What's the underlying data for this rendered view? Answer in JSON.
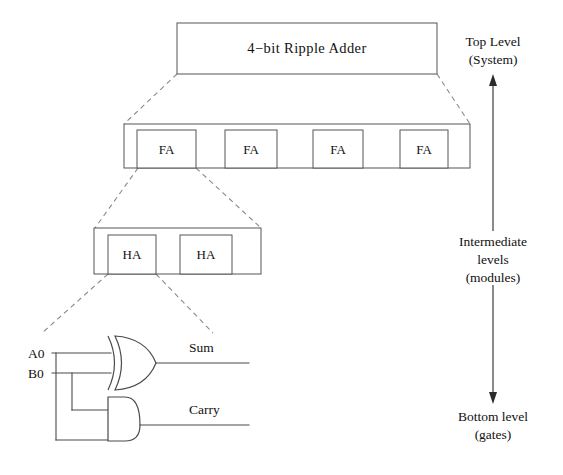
{
  "diagram": {
    "title_block": {
      "label": "4−bit Ripple Adder",
      "name": "top-level-system-block"
    },
    "intermediate_row_1": {
      "blocks": [
        {
          "label": "FA"
        },
        {
          "label": "FA"
        },
        {
          "label": "FA"
        },
        {
          "label": "FA"
        }
      ]
    },
    "intermediate_row_2": {
      "blocks": [
        {
          "label": "HA"
        },
        {
          "label": "HA"
        }
      ]
    },
    "gate_level": {
      "inputs": [
        {
          "label": "A0"
        },
        {
          "label": "B0"
        }
      ],
      "outputs": [
        {
          "label": "Sum",
          "gate": "xor-gate"
        },
        {
          "label": "Carry",
          "gate": "and-gate"
        }
      ]
    },
    "level_annotations": {
      "top": {
        "line1": "Top Level",
        "line2": "(System)"
      },
      "middle": {
        "line1": "Intermediate",
        "line2": "levels",
        "line3": "(modules)"
      },
      "bottom": {
        "line1": "Bottom level",
        "line2": "(gates)"
      }
    },
    "colors": {
      "background": "#ffffff",
      "box_stroke": "#555555",
      "dashed_link": "#8a8a8a",
      "wire": "#4a4a4a",
      "arrow": "#2b2b2b",
      "text": "#111111"
    }
  }
}
